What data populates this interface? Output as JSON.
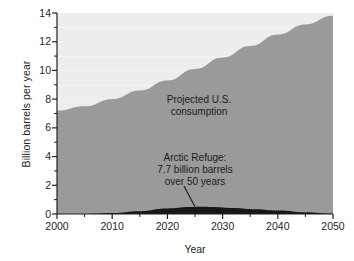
{
  "chart_data": {
    "type": "area",
    "title": "",
    "xlabel": "Year",
    "ylabel": "Billion barrels per year",
    "xlim": [
      2000,
      2050
    ],
    "ylim": [
      0,
      14
    ],
    "xticks": [
      2000,
      2010,
      2020,
      2030,
      2040,
      2050
    ],
    "xtick_labels": [
      "2000",
      "2010",
      "2020",
      "2030",
      "2040",
      "2050"
    ],
    "x_minor_tick_interval": 5,
    "yticks": [
      0,
      2,
      4,
      6,
      8,
      10,
      12,
      14
    ],
    "ytick_labels": [
      "0",
      "2",
      "4",
      "6",
      "8",
      "10",
      "12",
      "14"
    ],
    "y_minor_tick_interval": 1,
    "grid": false,
    "legend_position": "none",
    "background_color": "#ededed",
    "plot_frame": false,
    "series": [
      {
        "name": "Projected U.S. consumption",
        "type": "area",
        "color": "#9a9a9a",
        "x": [
          2000,
          2005,
          2010,
          2015,
          2020,
          2025,
          2030,
          2035,
          2040,
          2045,
          2050
        ],
        "values": [
          7.2,
          7.5,
          8.0,
          8.6,
          9.3,
          10.1,
          10.9,
          11.7,
          12.5,
          13.2,
          13.8
        ]
      },
      {
        "name": "Arctic Refuge: 7.7 billion barrels over 50 years",
        "type": "area",
        "color": "#171717",
        "x": [
          2000,
          2005,
          2010,
          2015,
          2020,
          2024,
          2026,
          2028,
          2032,
          2036,
          2040,
          2045,
          2050
        ],
        "values": [
          0.0,
          0.0,
          0.07,
          0.2,
          0.38,
          0.48,
          0.5,
          0.49,
          0.42,
          0.33,
          0.24,
          0.12,
          0.02
        ]
      }
    ],
    "annotations": [
      {
        "id": "consumption",
        "text": "Projected U.S.\nconsumption",
        "x": 2026,
        "y": 8.3,
        "leader_line": false
      },
      {
        "id": "arctic",
        "text": "Arctic Refuge:\n7.7 billion barrels\nover 50 years",
        "x": 2023,
        "y": 4.2,
        "leader_line": true,
        "leader_target_x": 2025,
        "leader_target_y": 0.5
      }
    ]
  },
  "axis": {
    "y_title": "Billion barrels per year",
    "x_title": "Year"
  },
  "colors": {
    "consumption_area": "#9a9a9a",
    "arctic_area": "#171717",
    "plot_background": "#ededed",
    "axis": "#231f20",
    "text": "#231f20"
  }
}
